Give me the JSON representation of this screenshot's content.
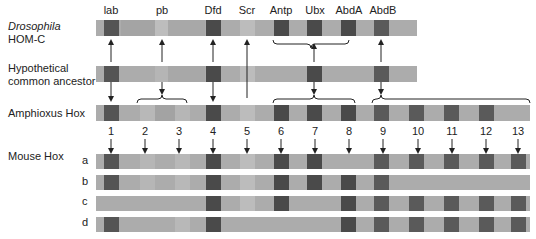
{
  "row_labels": {
    "drosophila_species": "Drosophila",
    "drosophila_cluster": "HOM-C",
    "ancestor_line1": "Hypothetical",
    "ancestor_line2": "common ancestor",
    "amphioxus": "Amphioxus Hox",
    "mouse": "Mouse Hox"
  },
  "drosophila_genes": [
    "lab",
    "pb",
    "Dfd",
    "Scr",
    "Antp",
    "Ubx",
    "AbdA",
    "AbdB"
  ],
  "paralog_numbers": [
    "1",
    "2",
    "3",
    "4",
    "5",
    "6",
    "7",
    "8",
    "9",
    "10",
    "11",
    "12",
    "13"
  ],
  "mouse_clusters": [
    "a",
    "b",
    "c",
    "d"
  ],
  "colors": {
    "bar": "#a9a9a9",
    "bar_light": "#b8b8b8",
    "box_dark": "#4d4d4d",
    "box_mid": "#5e5e5e",
    "arrow": "#222222"
  },
  "mouse_presence": {
    "a": [
      1,
      2,
      3,
      4,
      5,
      6,
      7,
      0,
      9,
      10,
      11,
      12,
      13
    ],
    "b": [
      1,
      2,
      3,
      4,
      5,
      6,
      7,
      8,
      9,
      0,
      0,
      0,
      0
    ],
    "c": [
      0,
      0,
      0,
      4,
      5,
      6,
      0,
      8,
      9,
      10,
      11,
      12,
      13
    ],
    "d": [
      1,
      0,
      3,
      4,
      0,
      0,
      0,
      8,
      9,
      10,
      11,
      12,
      13
    ]
  }
}
